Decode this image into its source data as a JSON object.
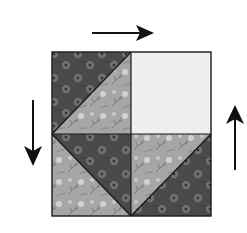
{
  "diagram": {
    "block": {
      "x": 52,
      "y": 52,
      "size_w": 159,
      "size_h": 164,
      "center": [
        131,
        134
      ],
      "quadrants": [
        {
          "position": "top-left",
          "type": "half-square-triangle",
          "diagonal": "top-right to bottom-left",
          "upper_fabric": "dark-floral",
          "lower_fabric": "light-floral"
        },
        {
          "position": "top-right",
          "type": "solid-square",
          "fabric": "plain-light"
        },
        {
          "position": "bottom-left",
          "type": "half-square-triangle",
          "diagonal": "top-left to bottom-right",
          "upper_fabric": "dark-floral",
          "lower_fabric": "light-floral"
        },
        {
          "position": "bottom-right",
          "type": "half-square-triangle",
          "diagonal": "top-right to bottom-left",
          "upper_fabric": "light-floral",
          "lower_fabric": "dark-floral"
        }
      ]
    },
    "arrows": [
      {
        "name": "top-arrow",
        "direction": "right",
        "x1": 92,
        "y1": 33,
        "x2": 154,
        "y2": 33
      },
      {
        "name": "left-arrow",
        "direction": "down",
        "x1": 33,
        "y1": 100,
        "x2": 33,
        "y2": 166
      },
      {
        "name": "right-arrow",
        "direction": "up",
        "x1": 235,
        "y1": 170,
        "x2": 235,
        "y2": 105
      }
    ],
    "colors": {
      "dark_fabric": "#4a4a4a",
      "dark_flower": "#777777",
      "light_fabric": "#a6a6a6",
      "light_flower": "#d6d6d6",
      "plain_light": "#efefef",
      "outline": "#1a1a1a",
      "arrow": "#111111"
    }
  }
}
